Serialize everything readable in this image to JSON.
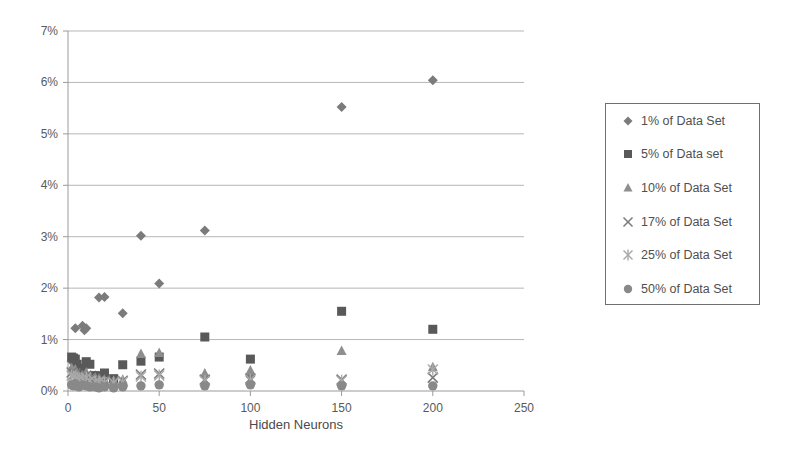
{
  "chart_data": {
    "type": "scatter",
    "title": "",
    "xlabel": "Hidden Neurons",
    "ylabel": "",
    "xlim": [
      0,
      250
    ],
    "ylim": [
      0,
      7
    ],
    "xticks": [
      "0",
      "50",
      "100",
      "150",
      "200",
      "250"
    ],
    "xtick_values": [
      0,
      50,
      100,
      150,
      200,
      250
    ],
    "yticks": [
      "0%",
      "1%",
      "2%",
      "3%",
      "4%",
      "5%",
      "6%",
      "7%"
    ],
    "ytick_values": [
      0,
      1,
      2,
      3,
      4,
      5,
      6,
      7
    ],
    "grid": true,
    "legend_position": "right",
    "series": [
      {
        "name": "1% of Data Set",
        "marker": "diamond",
        "color": "#7b7b7b",
        "points": [
          {
            "x": 2,
            "y": 0.58
          },
          {
            "x": 3,
            "y": 0.45
          },
          {
            "x": 4,
            "y": 1.22
          },
          {
            "x": 5,
            "y": 0.35
          },
          {
            "x": 6,
            "y": 0.3
          },
          {
            "x": 8,
            "y": 1.27
          },
          {
            "x": 9,
            "y": 1.18
          },
          {
            "x": 10,
            "y": 1.22
          },
          {
            "x": 12,
            "y": 0.25
          },
          {
            "x": 15,
            "y": 0.3
          },
          {
            "x": 17,
            "y": 1.82
          },
          {
            "x": 20,
            "y": 1.83
          },
          {
            "x": 25,
            "y": 0.22
          },
          {
            "x": 30,
            "y": 1.51
          },
          {
            "x": 40,
            "y": 3.02
          },
          {
            "x": 50,
            "y": 2.09
          },
          {
            "x": 75,
            "y": 3.12
          },
          {
            "x": 100,
            "y": 0.28
          },
          {
            "x": 150,
            "y": 5.52
          },
          {
            "x": 200,
            "y": 6.04
          }
        ]
      },
      {
        "name": "5% of Data set",
        "marker": "square",
        "color": "#595959",
        "points": [
          {
            "x": 2,
            "y": 0.66
          },
          {
            "x": 3,
            "y": 0.64
          },
          {
            "x": 4,
            "y": 0.62
          },
          {
            "x": 5,
            "y": 0.52
          },
          {
            "x": 6,
            "y": 0.44
          },
          {
            "x": 8,
            "y": 0.4
          },
          {
            "x": 10,
            "y": 0.57
          },
          {
            "x": 12,
            "y": 0.52
          },
          {
            "x": 15,
            "y": 0.3
          },
          {
            "x": 17,
            "y": 0.28
          },
          {
            "x": 20,
            "y": 0.35
          },
          {
            "x": 25,
            "y": 0.24
          },
          {
            "x": 30,
            "y": 0.51
          },
          {
            "x": 40,
            "y": 0.58
          },
          {
            "x": 50,
            "y": 0.66
          },
          {
            "x": 75,
            "y": 1.05
          },
          {
            "x": 100,
            "y": 0.62
          },
          {
            "x": 150,
            "y": 1.55
          },
          {
            "x": 200,
            "y": 1.2
          }
        ]
      },
      {
        "name": "10% of Data Set",
        "marker": "triangle",
        "color": "#8e8e8e",
        "points": [
          {
            "x": 2,
            "y": 0.44
          },
          {
            "x": 3,
            "y": 0.38
          },
          {
            "x": 4,
            "y": 0.42
          },
          {
            "x": 5,
            "y": 0.34
          },
          {
            "x": 6,
            "y": 0.3
          },
          {
            "x": 8,
            "y": 0.3
          },
          {
            "x": 10,
            "y": 0.36
          },
          {
            "x": 12,
            "y": 0.28
          },
          {
            "x": 15,
            "y": 0.26
          },
          {
            "x": 17,
            "y": 0.24
          },
          {
            "x": 20,
            "y": 0.22
          },
          {
            "x": 25,
            "y": 0.2
          },
          {
            "x": 30,
            "y": 0.22
          },
          {
            "x": 40,
            "y": 0.72
          },
          {
            "x": 50,
            "y": 0.74
          },
          {
            "x": 75,
            "y": 0.34
          },
          {
            "x": 100,
            "y": 0.4
          },
          {
            "x": 150,
            "y": 0.78
          },
          {
            "x": 200,
            "y": 0.46
          }
        ]
      },
      {
        "name": "17% of Data Set",
        "marker": "cross",
        "color": "#7d7d7d",
        "points": [
          {
            "x": 2,
            "y": 0.36
          },
          {
            "x": 3,
            "y": 0.32
          },
          {
            "x": 4,
            "y": 0.34
          },
          {
            "x": 5,
            "y": 0.28
          },
          {
            "x": 6,
            "y": 0.26
          },
          {
            "x": 8,
            "y": 0.28
          },
          {
            "x": 10,
            "y": 0.3
          },
          {
            "x": 12,
            "y": 0.24
          },
          {
            "x": 15,
            "y": 0.22
          },
          {
            "x": 17,
            "y": 0.2
          },
          {
            "x": 20,
            "y": 0.2
          },
          {
            "x": 25,
            "y": 0.18
          },
          {
            "x": 30,
            "y": 0.2
          },
          {
            "x": 40,
            "y": 0.32
          },
          {
            "x": 50,
            "y": 0.34
          },
          {
            "x": 75,
            "y": 0.22
          },
          {
            "x": 100,
            "y": 0.24
          },
          {
            "x": 150,
            "y": 0.22
          },
          {
            "x": 200,
            "y": 0.26
          }
        ]
      },
      {
        "name": "25% of Data Set",
        "marker": "star",
        "color": "#a9a9a9",
        "points": [
          {
            "x": 2,
            "y": 0.3
          },
          {
            "x": 3,
            "y": 0.28
          },
          {
            "x": 4,
            "y": 0.26
          },
          {
            "x": 5,
            "y": 0.24
          },
          {
            "x": 6,
            "y": 0.22
          },
          {
            "x": 8,
            "y": 0.24
          },
          {
            "x": 10,
            "y": 0.26
          },
          {
            "x": 12,
            "y": 0.2
          },
          {
            "x": 15,
            "y": 0.18
          },
          {
            "x": 17,
            "y": 0.18
          },
          {
            "x": 20,
            "y": 0.16
          },
          {
            "x": 25,
            "y": 0.16
          },
          {
            "x": 30,
            "y": 0.18
          },
          {
            "x": 40,
            "y": 0.28
          },
          {
            "x": 50,
            "y": 0.3
          },
          {
            "x": 75,
            "y": 0.2
          },
          {
            "x": 100,
            "y": 0.22
          },
          {
            "x": 150,
            "y": 0.2
          },
          {
            "x": 200,
            "y": 0.42
          }
        ]
      },
      {
        "name": "50% of Data Set",
        "marker": "circle",
        "color": "#898989",
        "points": [
          {
            "x": 2,
            "y": 0.12
          },
          {
            "x": 3,
            "y": 0.1
          },
          {
            "x": 4,
            "y": 0.14
          },
          {
            "x": 5,
            "y": 0.1
          },
          {
            "x": 6,
            "y": 0.08
          },
          {
            "x": 8,
            "y": 0.12
          },
          {
            "x": 10,
            "y": 0.1
          },
          {
            "x": 12,
            "y": 0.08
          },
          {
            "x": 15,
            "y": 0.08
          },
          {
            "x": 17,
            "y": 0.06
          },
          {
            "x": 20,
            "y": 0.08
          },
          {
            "x": 25,
            "y": 0.06
          },
          {
            "x": 30,
            "y": 0.08
          },
          {
            "x": 40,
            "y": 0.1
          },
          {
            "x": 50,
            "y": 0.12
          },
          {
            "x": 75,
            "y": 0.1
          },
          {
            "x": 100,
            "y": 0.12
          },
          {
            "x": 150,
            "y": 0.1
          },
          {
            "x": 200,
            "y": 0.1
          }
        ]
      }
    ]
  },
  "legend": {
    "entries": [
      {
        "label": "1% of Data Set",
        "marker": "diamond-marker-icon"
      },
      {
        "label": "5% of Data set",
        "marker": "square-marker-icon"
      },
      {
        "label": "10% of Data Set",
        "marker": "triangle-marker-icon"
      },
      {
        "label": "17% of Data Set",
        "marker": "cross-marker-icon"
      },
      {
        "label": "25% of Data Set",
        "marker": "star-marker-icon"
      },
      {
        "label": "50% of Data Set",
        "marker": "circle-marker-icon"
      }
    ]
  }
}
